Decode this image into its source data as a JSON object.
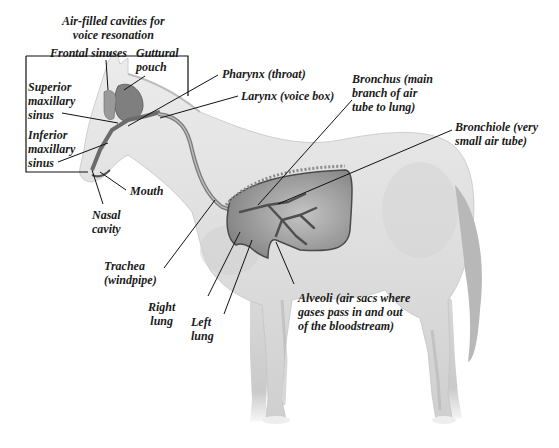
{
  "figure": {
    "title_cutoff": "",
    "colors": {
      "background": "#ffffff",
      "label_text": "#1a1a1a",
      "leader_line": "#111111",
      "horse_body": "#e4e4e4",
      "horse_shadow": "#c8c8c8",
      "organ_dark": "#777777",
      "lung_fill": "#a9a9a9"
    }
  },
  "labels": {
    "air_cavities": "Air-filled cavities for\nvoice resonation",
    "frontal_sinuses": "Frontal sinuses",
    "guttural_pouch": "Guttural\npouch",
    "superior_maxillary_sinus": "Superior\nmaxillary\nsinus",
    "inferior_maxillary_sinus": "Inferior\nmaxillary\nsinus",
    "pharynx": "Pharynx (throat)",
    "larynx": "Larynx (voice box)",
    "bronchus": "Bronchus (main\nbranch of air\ntube to lung)",
    "bronchiole": "Bronchiole (very\nsmall air tube)",
    "mouth": "Mouth",
    "nasal_cavity": "Nasal\ncavity",
    "trachea": "Trachea\n(windpipe)",
    "right_lung": "Right\nlung",
    "left_lung": "Left\nlung",
    "alveoli": "Alveoli (air sacs where\ngases pass in and out\nof the bloodstream)"
  }
}
